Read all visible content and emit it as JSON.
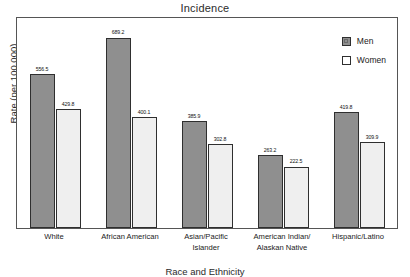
{
  "chart_data": {
    "type": "bar",
    "title": "Incidence",
    "xlabel": "Race and Ethnicity",
    "ylabel": "Rate (per 100,000)",
    "categories": [
      "White",
      "African American",
      "Asian/Pacific Islander",
      "American Indian/Alaskan Native",
      "Hispanic/Latino"
    ],
    "category_lines": [
      [
        "White"
      ],
      [
        "African American"
      ],
      [
        "Asian/Pacific",
        "Islander"
      ],
      [
        "American Indian/",
        "Alaskan Native"
      ],
      [
        "Hispanic/Latino"
      ]
    ],
    "series": [
      {
        "name": "Men",
        "values": [
          556.5,
          689.2,
          385.9,
          263.2,
          419.8
        ],
        "color": "#8f8f8f"
      },
      {
        "name": "Women",
        "values": [
          429.8,
          400.1,
          302.8,
          222.5,
          309.9
        ],
        "color": "#efefef"
      }
    ],
    "value_labels": {
      "men": [
        "556.5",
        "689.2",
        "385.9",
        "263.2",
        "419.8"
      ],
      "women": [
        "429.8",
        "400.1",
        "302.8",
        "222.5",
        "309.9"
      ]
    },
    "ylim": [
      0,
      760
    ],
    "y_ticks_visible": false,
    "grid": false,
    "legend_position": "top-right-inside",
    "legend_entries": [
      "Men",
      "Women"
    ]
  },
  "colors": {
    "men_fill": "#8f8f8f",
    "women_fill": "#efefef",
    "bar_outline": "#2f2f2f",
    "frame": "#555555",
    "background": "#ffffff",
    "text": "#1a1a1a"
  }
}
